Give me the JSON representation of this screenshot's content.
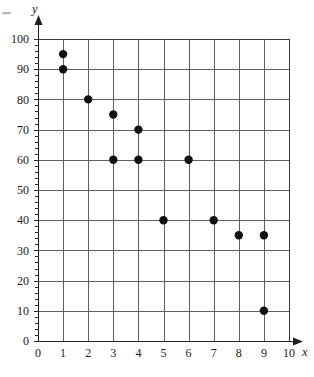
{
  "chart_data": {
    "type": "scatter",
    "title": "",
    "subtitle": "",
    "xlabel": "x",
    "ylabel": "y",
    "xlim": [
      0,
      10
    ],
    "ylim": [
      0,
      100
    ],
    "grid": true,
    "legend": null,
    "legend_position": "none",
    "x_ticks": [
      0,
      1,
      2,
      3,
      4,
      5,
      6,
      7,
      8,
      9,
      10
    ],
    "x_tick_labels": [
      "0",
      "1",
      "2",
      "3",
      "4",
      "5",
      "6",
      "7",
      "8",
      "9",
      "10"
    ],
    "y_ticks": [
      0,
      10,
      20,
      30,
      40,
      50,
      60,
      70,
      80,
      90,
      100
    ],
    "y_tick_labels": [
      "0",
      "10",
      "20",
      "30",
      "40",
      "50",
      "60",
      "70",
      "80",
      "90",
      "100"
    ],
    "y_minor_tick_step": 2,
    "x": [
      1,
      1,
      2,
      3,
      4,
      3,
      4,
      6,
      5,
      7,
      8,
      9,
      9
    ],
    "y": [
      95,
      90,
      80,
      75,
      70,
      60,
      60,
      60,
      40,
      40,
      35,
      35,
      10
    ],
    "points": [
      {
        "x": 1,
        "y": 95
      },
      {
        "x": 1,
        "y": 90
      },
      {
        "x": 2,
        "y": 80
      },
      {
        "x": 3,
        "y": 75
      },
      {
        "x": 4,
        "y": 70
      },
      {
        "x": 3,
        "y": 60
      },
      {
        "x": 4,
        "y": 60
      },
      {
        "x": 6,
        "y": 60
      },
      {
        "x": 5,
        "y": 40
      },
      {
        "x": 7,
        "y": 40
      },
      {
        "x": 8,
        "y": 35
      },
      {
        "x": 9,
        "y": 35
      },
      {
        "x": 9,
        "y": 10
      }
    ],
    "marker": "filled-circle",
    "marker_color": "#111111",
    "marker_size": 4.2,
    "gridline_color": "#5f5f5f",
    "axis_color": "#1f1f1f",
    "background_color": "#ffffff"
  },
  "axes": {
    "x_label": "x",
    "y_label": "y"
  }
}
